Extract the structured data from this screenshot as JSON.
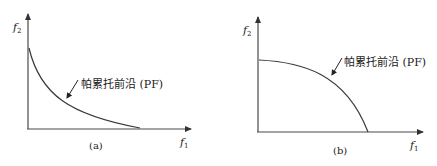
{
  "panels": [
    {
      "id": "a",
      "caption": "(a)",
      "x_axis_label": "f",
      "x_axis_sub": "1",
      "y_axis_label": "f",
      "y_axis_sub": "2",
      "curve_label": "帕累托前沿 (PF)",
      "curve_shape": "convex"
    },
    {
      "id": "b",
      "caption": "(b)",
      "x_axis_label": "f",
      "x_axis_sub": "1",
      "y_axis_label": "f",
      "y_axis_sub": "2",
      "curve_label": "帕累托前沿 (PF)",
      "curve_shape": "concave"
    }
  ],
  "colors": {
    "axis": "#4a4a4a",
    "curve": "#3a3a3a",
    "text": "#1a1a1a"
  }
}
